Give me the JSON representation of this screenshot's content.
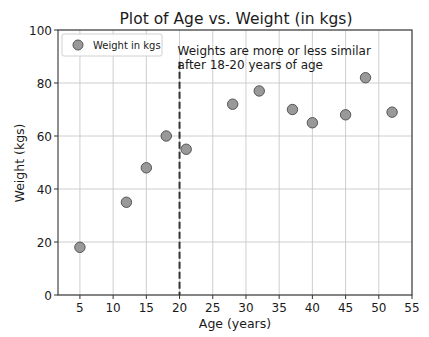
{
  "chart_data": {
    "type": "scatter",
    "title": "Plot of Age vs. Weight (in kgs)",
    "xlabel": "Age (years)",
    "ylabel": "Weight (kgs)",
    "xlim": [
      1.7,
      55
    ],
    "ylim": [
      0,
      100
    ],
    "xticks": [
      5,
      10,
      15,
      20,
      25,
      30,
      35,
      40,
      45,
      50,
      55
    ],
    "yticks": [
      0,
      20,
      40,
      60,
      80,
      100
    ],
    "grid": true,
    "legend": {
      "position": "upper left",
      "entries": [
        "Weight in kgs"
      ]
    },
    "series": [
      {
        "name": "Weight in kgs",
        "color": "#999999",
        "edgecolor": "#555555",
        "x": [
          5,
          12,
          15,
          18,
          21,
          28,
          32,
          37,
          40,
          45,
          48,
          52
        ],
        "y": [
          18,
          35,
          48,
          60,
          55,
          72,
          77,
          70,
          65,
          68,
          82,
          69
        ]
      }
    ],
    "vline": {
      "x": 20,
      "style": "dashed",
      "color": "#333333"
    },
    "annotation": {
      "lines": [
        "Weights are more or less similar",
        "after 18-20 years of age"
      ],
      "x": 20,
      "y": 94
    }
  },
  "plot": {
    "left": 58,
    "right": 412,
    "top": 30,
    "bottom": 295
  }
}
